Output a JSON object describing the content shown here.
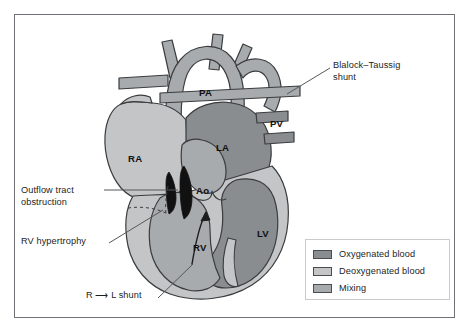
{
  "figure": {
    "background": "#ffffff",
    "frame_color": "#6e7276"
  },
  "colors": {
    "oxygenated": "#8a8d90",
    "deoxygenated": "#c3c5c7",
    "mixing": "#a8abad",
    "outline": "#3a3c3e",
    "obstruction": "#111111",
    "leader_line": "#555759",
    "text": "#1d1d1d"
  },
  "chamber_labels": [
    {
      "id": "pa",
      "text": "PA"
    },
    {
      "id": "pv",
      "text": "PV"
    },
    {
      "id": "ra",
      "text": "RA"
    },
    {
      "id": "la",
      "text": "LA"
    },
    {
      "id": "ao",
      "text": "Ao"
    },
    {
      "id": "rv",
      "text": "RV"
    },
    {
      "id": "lv",
      "text": "LV"
    }
  ],
  "annotations": [
    {
      "id": "bt-shunt",
      "text": "Blalock–Taussig\nshunt"
    },
    {
      "id": "outflow-tract",
      "text": "Outflow tract\nobstruction"
    },
    {
      "id": "rv-hypertrophy",
      "text": "RV hypertrophy"
    },
    {
      "id": "rl-shunt",
      "text": "R ⟶ L shunt"
    }
  ],
  "legend": {
    "items": [
      {
        "label": "Oxygenated blood",
        "color": "#8a8d90"
      },
      {
        "label": "Deoxygenated blood",
        "color": "#c3c5c7"
      },
      {
        "label": "Mixing",
        "color": "#a8abad"
      }
    ]
  }
}
